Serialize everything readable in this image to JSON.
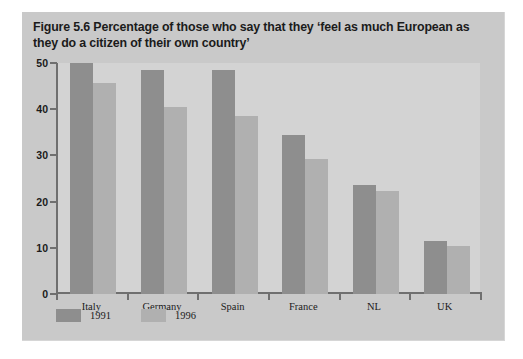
{
  "figure": {
    "title": "Figure 5.6  Percentage of those who say that they ‘feel as much European as they do a citizen of their own country’",
    "panel_bg": "#c9c9c9",
    "plot_bg": "#d3d3d3",
    "axis_color": "#6f6f6f"
  },
  "chart_data": {
    "type": "bar",
    "title": "Figure 5.6  Percentage of those who say that they ‘feel as much European as they do a citizen of their own country’",
    "xlabel": "",
    "ylabel": "",
    "ylim": [
      0,
      50
    ],
    "yticks": [
      0,
      10,
      20,
      30,
      40,
      50
    ],
    "ytick_labels": [
      "0",
      "10",
      "20",
      "30",
      "40",
      "50"
    ],
    "grid": false,
    "legend_position": "bottom-left",
    "categories": [
      "Italy",
      "Germany",
      "Spain",
      "France",
      "NL",
      "UK"
    ],
    "series": [
      {
        "name": "1991",
        "color": "#8e8e8e",
        "values": [
          50.0,
          48.5,
          48.5,
          34.5,
          23.5,
          11.4
        ]
      },
      {
        "name": "1996",
        "color": "#b0b0b0",
        "values": [
          45.6,
          40.5,
          38.5,
          29.3,
          22.4,
          10.3
        ]
      }
    ]
  },
  "legend": [
    {
      "label": "1991",
      "color": "#8e8e8e"
    },
    {
      "label": "1996",
      "color": "#b0b0b0"
    }
  ]
}
